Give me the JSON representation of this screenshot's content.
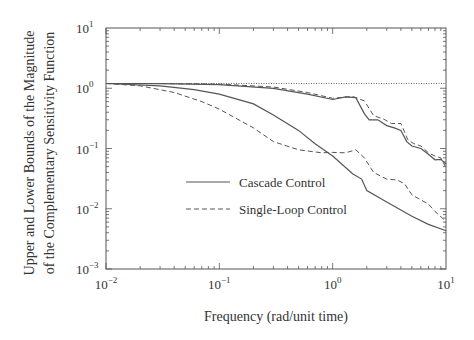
{
  "chart_data": {
    "type": "line",
    "title": "",
    "xlabel": "Frequency (rad/unit time)",
    "ylabel_line1": "Upper and Lower Bounds of the Magnitude",
    "ylabel_line2": "of the Complementary Sensitivity Function",
    "xscale": "log",
    "yscale": "log",
    "xlim": [
      0.01,
      10
    ],
    "ylim": [
      0.001,
      10
    ],
    "x_ticks": [
      {
        "value": 0.01,
        "base": "10",
        "exp": "−2"
      },
      {
        "value": 0.1,
        "base": "10",
        "exp": "−1"
      },
      {
        "value": 1,
        "base": "10",
        "exp": "0"
      },
      {
        "value": 10,
        "base": "10",
        "exp": "1"
      }
    ],
    "y_ticks": [
      {
        "value": 10,
        "base": "10",
        "exp": "1"
      },
      {
        "value": 1,
        "base": "10",
        "exp": "0"
      },
      {
        "value": 0.1,
        "base": "10",
        "exp": "−1"
      },
      {
        "value": 0.01,
        "base": "10",
        "exp": "−2"
      },
      {
        "value": 0.001,
        "base": "10",
        "exp": "−3"
      }
    ],
    "grid": false,
    "legend_position": "inside-lower-left",
    "reference_line": {
      "name": "unity (dotted)",
      "y": 1.2,
      "style": "dotted"
    },
    "series": [
      {
        "name": "Cascade Control (upper bound)",
        "legend": "Cascade Control",
        "style": "solid",
        "points": [
          [
            0.01,
            1.2
          ],
          [
            0.03,
            1.19
          ],
          [
            0.1,
            1.15
          ],
          [
            0.3,
            1.0
          ],
          [
            0.6,
            0.8
          ],
          [
            1.0,
            0.65
          ],
          [
            1.3,
            0.72
          ],
          [
            1.6,
            0.7
          ],
          [
            1.9,
            0.38
          ],
          [
            2.1,
            0.3
          ],
          [
            2.5,
            0.3
          ],
          [
            3.0,
            0.24
          ],
          [
            3.5,
            0.22
          ],
          [
            4.0,
            0.2
          ],
          [
            4.5,
            0.13
          ],
          [
            5.0,
            0.11
          ],
          [
            6.0,
            0.1
          ],
          [
            7.0,
            0.08
          ],
          [
            8.0,
            0.065
          ],
          [
            9.0,
            0.066
          ],
          [
            10,
            0.055
          ]
        ]
      },
      {
        "name": "Cascade Control (lower bound)",
        "legend": "",
        "style": "solid",
        "points": [
          [
            0.01,
            1.2
          ],
          [
            0.03,
            1.1
          ],
          [
            0.06,
            0.95
          ],
          [
            0.1,
            0.8
          ],
          [
            0.2,
            0.55
          ],
          [
            0.3,
            0.36
          ],
          [
            0.5,
            0.2
          ],
          [
            0.7,
            0.12
          ],
          [
            1.0,
            0.075
          ],
          [
            1.5,
            0.038
          ],
          [
            1.8,
            0.031
          ],
          [
            2.0,
            0.02
          ],
          [
            3.0,
            0.013
          ],
          [
            5.0,
            0.0075
          ],
          [
            7.0,
            0.0055
          ],
          [
            10,
            0.0043
          ]
        ]
      },
      {
        "name": "Single-Loop Control (upper bound)",
        "legend": "Single-Loop Control",
        "style": "dashed",
        "points": [
          [
            0.01,
            1.2
          ],
          [
            0.03,
            1.2
          ],
          [
            0.1,
            1.17
          ],
          [
            0.3,
            1.05
          ],
          [
            0.6,
            0.85
          ],
          [
            1.0,
            0.68
          ],
          [
            1.5,
            0.73
          ],
          [
            1.9,
            0.62
          ],
          [
            2.3,
            0.35
          ],
          [
            2.8,
            0.31
          ],
          [
            3.3,
            0.26
          ],
          [
            4.0,
            0.26
          ],
          [
            4.6,
            0.14
          ],
          [
            5.2,
            0.12
          ],
          [
            6.0,
            0.11
          ],
          [
            7.0,
            0.085
          ],
          [
            8.0,
            0.075
          ],
          [
            9.0,
            0.07
          ],
          [
            10,
            0.048
          ]
        ]
      },
      {
        "name": "Single-Loop Control (lower bound)",
        "legend": "",
        "style": "dashed",
        "points": [
          [
            0.01,
            1.2
          ],
          [
            0.02,
            1.1
          ],
          [
            0.04,
            0.85
          ],
          [
            0.07,
            0.6
          ],
          [
            0.1,
            0.45
          ],
          [
            0.2,
            0.22
          ],
          [
            0.3,
            0.13
          ],
          [
            0.5,
            0.095
          ],
          [
            0.8,
            0.085
          ],
          [
            1.0,
            0.086
          ],
          [
            1.3,
            0.085
          ],
          [
            1.6,
            0.095
          ],
          [
            1.9,
            0.07
          ],
          [
            2.3,
            0.04
          ],
          [
            3.0,
            0.031
          ],
          [
            3.7,
            0.03
          ],
          [
            4.3,
            0.026
          ],
          [
            5.0,
            0.017
          ],
          [
            6.0,
            0.014
          ],
          [
            7.0,
            0.012
          ],
          [
            8.0,
            0.009
          ],
          [
            10,
            0.0062
          ]
        ]
      }
    ]
  },
  "legend": {
    "cascade_label": "Cascade Control",
    "single_label": "Single-Loop Control"
  }
}
